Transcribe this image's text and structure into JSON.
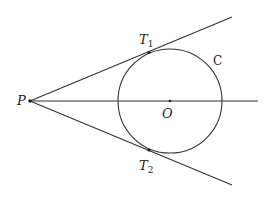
{
  "diagram": {
    "labels": {
      "P": "P",
      "O": "O",
      "C": "C",
      "T1": "T",
      "T1_sub": "1",
      "T2": "T",
      "T2_sub": "2"
    },
    "points": {
      "P": [
        30,
        101
      ],
      "O": [
        170,
        101
      ],
      "T1": [
        149,
        52
      ],
      "T2": [
        149,
        151
      ]
    },
    "circle": {
      "cx": 170,
      "cy": 101,
      "r": 52
    },
    "colors": {
      "stroke": "#333333",
      "background": "#ffffff"
    }
  }
}
